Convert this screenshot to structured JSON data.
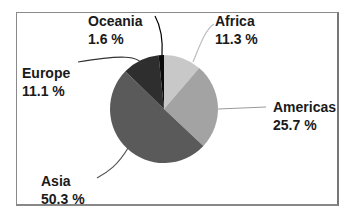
{
  "chart_data": {
    "type": "pie",
    "title": "",
    "categories": [
      "Africa",
      "Americas",
      "Asia",
      "Europe",
      "Oceania"
    ],
    "values": [
      11.3,
      25.7,
      50.3,
      11.1,
      1.6
    ],
    "unit": "%",
    "colors": [
      "#c8c8c8",
      "#a3a3a3",
      "#5a5a5a",
      "#2e2e2e",
      "#0a0a0a"
    ],
    "labels": [
      {
        "name": "Africa",
        "value": "11.3 %"
      },
      {
        "name": "Americas",
        "value": "25.7 %"
      },
      {
        "name": "Asia",
        "value": "50.3 %"
      },
      {
        "name": "Europe",
        "value": "11.1 %"
      },
      {
        "name": "Oceania",
        "value": "1.6 %"
      }
    ],
    "legend": "none (leader-line labels)"
  }
}
